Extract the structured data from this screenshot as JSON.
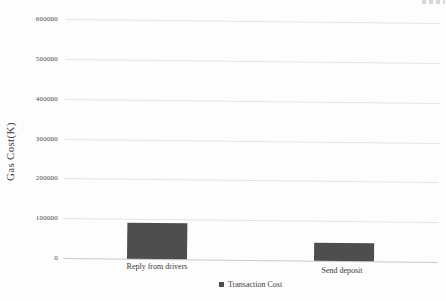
{
  "figure": {
    "background": "#fdfdfd"
  },
  "chart_data": {
    "type": "bar",
    "title": "",
    "xlabel": "",
    "ylabel": "Gas Cost(K)",
    "categories": [
      "Reply from drivers",
      "Send deposit"
    ],
    "series": [
      {
        "name": "Transaction Cost",
        "values": [
          90000,
          45000
        ]
      }
    ],
    "ylim": [
      0,
      600000
    ],
    "yticks": [
      0,
      100000,
      200000,
      300000,
      400000,
      500000,
      600000
    ],
    "ytick_labels": [
      "0",
      "100000",
      "200000",
      "300000",
      "400000",
      "500000",
      "600000"
    ],
    "grid": "horizontal",
    "legend_position": "bottom",
    "legend_marker": "square",
    "bar_color": "#4e4e4e",
    "gridline_color": "#e4e4e6",
    "axis_line_color": "#c9c9cc",
    "text_color": "#3a3a3a"
  }
}
